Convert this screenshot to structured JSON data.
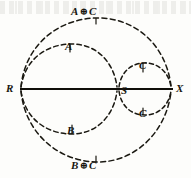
{
  "figure": {
    "type": "geometric-diagram",
    "background_color": "#fdfdfb",
    "ink_color": "#18160f",
    "points": [
      {
        "id": "R",
        "label": "R",
        "x": 20,
        "y": 89
      },
      {
        "id": "S",
        "label": "S",
        "x": 118,
        "y": 89
      },
      {
        "id": "X",
        "label": "X",
        "x": 172,
        "y": 89
      }
    ],
    "baseline": {
      "name": "axis-line",
      "style": "solid",
      "from": "R",
      "to": "X"
    },
    "curves": [
      {
        "id": "outer",
        "label_top": "A ⊕ C",
        "label_bottom": "B ⊕ C",
        "style": "dashed",
        "from": "R",
        "to": "X",
        "note": "large outer closed oval spanning R to X"
      },
      {
        "id": "inner-left",
        "label_top": "A",
        "label_bottom": "B",
        "style": "dashed",
        "from": "R",
        "to": "S",
        "note": "inner closed oval spanning R to S"
      },
      {
        "id": "inner-right",
        "label_top": "C",
        "label_bottom": "C",
        "style": "dashed",
        "from": "S",
        "to": "X",
        "note": "small closed oval spanning S to X"
      }
    ],
    "labels": {
      "point_r": "R",
      "point_s": "S",
      "point_x": "X",
      "curve_a": "A",
      "curve_b": "B",
      "curve_c_upper": "C",
      "curve_c_lower": "C",
      "comb_top_left": "A",
      "comb_top_op": "⊕",
      "comb_top_right": "C",
      "comb_bottom_left": "B",
      "comb_bottom_op": "⊕",
      "comb_bottom_right": "C"
    }
  }
}
